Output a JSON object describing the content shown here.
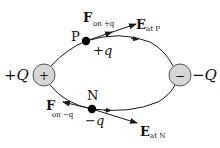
{
  "diagram": {
    "colors": {
      "line": "#1a1a1a",
      "charge_fill": "#d6d6d6",
      "charge_stroke": "#555555",
      "dot": "#000000",
      "background": "#ffffff"
    },
    "charges": {
      "positive": {
        "symbol": "+",
        "label": "+Q"
      },
      "negative": {
        "symbol": "−",
        "label": "−Q"
      }
    },
    "points": {
      "P": {
        "name": "P",
        "charge_label": "+q",
        "force_label_main": "F",
        "force_label_sub": "on +q",
        "field_label_main": "E",
        "field_label_sub": "at P"
      },
      "N": {
        "name": "N",
        "charge_label": "−q",
        "force_label_main": "F",
        "force_label_sub": "on −q",
        "field_label_main": "E",
        "field_label_sub": "at N"
      }
    }
  }
}
